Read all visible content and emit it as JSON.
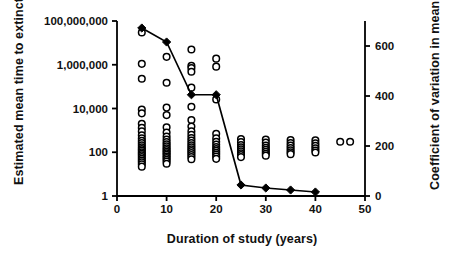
{
  "chart_data": {
    "type": "scatter",
    "title": "",
    "xlabel": "Duration of study (years)",
    "ylabel_left": "Estimated mean time to extinction (o)",
    "ylabel_right": "Coefficient of variation in mean time to extinction (line)",
    "xlim": [
      0,
      50
    ],
    "xticks": [
      0,
      10,
      20,
      30,
      40,
      50
    ],
    "xticklabels": [
      "0",
      "10",
      "20",
      "30",
      "40",
      "50"
    ],
    "left_axis": {
      "scale": "log",
      "ylim": [
        1,
        100000000
      ],
      "yticks": [
        1,
        100,
        10000,
        1000000,
        100000000
      ],
      "yticklabels": [
        "1",
        "100",
        "10,000",
        "1,000,000",
        "100,000,000"
      ]
    },
    "right_axis": {
      "scale": "linear",
      "ylim": [
        0,
        700
      ],
      "yticks": [
        0,
        200,
        400,
        600
      ],
      "yticklabels": [
        "0",
        "200",
        "400",
        "600"
      ]
    },
    "grid": false,
    "legend": "none (encoded in axis titles: open circles = mean time to extinction, line = coefficient of variation)",
    "series": [
      {
        "name": "Coefficient of variation in mean time to extinction",
        "marker": "filled-diamond",
        "line": true,
        "axis": "right",
        "x": [
          5,
          10,
          15,
          20,
          25,
          30,
          35,
          40
        ],
        "values": [
          672,
          616,
          405,
          405,
          44,
          32,
          24,
          16
        ]
      },
      {
        "name": "Estimated mean time to extinction",
        "marker": "open-circle",
        "line": false,
        "axis": "left",
        "points": [
          {
            "x": 5,
            "y": 30000000
          },
          {
            "x": 5,
            "y": 1100000
          },
          {
            "x": 5,
            "y": 230000
          },
          {
            "x": 5,
            "y": 9000
          },
          {
            "x": 5,
            "y": 6000
          },
          {
            "x": 5,
            "y": 2000
          },
          {
            "x": 5,
            "y": 1300
          },
          {
            "x": 5,
            "y": 900
          },
          {
            "x": 5,
            "y": 600
          },
          {
            "x": 5,
            "y": 430
          },
          {
            "x": 5,
            "y": 330
          },
          {
            "x": 5,
            "y": 260
          },
          {
            "x": 5,
            "y": 210
          },
          {
            "x": 5,
            "y": 170
          },
          {
            "x": 5,
            "y": 140
          },
          {
            "x": 5,
            "y": 120
          },
          {
            "x": 5,
            "y": 100
          },
          {
            "x": 5,
            "y": 85
          },
          {
            "x": 5,
            "y": 72
          },
          {
            "x": 5,
            "y": 60
          },
          {
            "x": 5,
            "y": 50
          },
          {
            "x": 5,
            "y": 42
          },
          {
            "x": 5,
            "y": 35
          },
          {
            "x": 5,
            "y": 28
          },
          {
            "x": 5,
            "y": 22
          },
          {
            "x": 10,
            "y": 2300000
          },
          {
            "x": 10,
            "y": 150000
          },
          {
            "x": 10,
            "y": 11000
          },
          {
            "x": 10,
            "y": 5000
          },
          {
            "x": 10,
            "y": 1400
          },
          {
            "x": 10,
            "y": 800
          },
          {
            "x": 10,
            "y": 520
          },
          {
            "x": 10,
            "y": 380
          },
          {
            "x": 10,
            "y": 290
          },
          {
            "x": 10,
            "y": 230
          },
          {
            "x": 10,
            "y": 185
          },
          {
            "x": 10,
            "y": 150
          },
          {
            "x": 10,
            "y": 125
          },
          {
            "x": 10,
            "y": 105
          },
          {
            "x": 10,
            "y": 90
          },
          {
            "x": 10,
            "y": 76
          },
          {
            "x": 10,
            "y": 64
          },
          {
            "x": 10,
            "y": 54
          },
          {
            "x": 10,
            "y": 45
          },
          {
            "x": 10,
            "y": 38
          },
          {
            "x": 10,
            "y": 30
          },
          {
            "x": 15,
            "y": 5000000
          },
          {
            "x": 15,
            "y": 900000
          },
          {
            "x": 15,
            "y": 700000
          },
          {
            "x": 15,
            "y": 480000
          },
          {
            "x": 15,
            "y": 90000
          },
          {
            "x": 15,
            "y": 12000
          },
          {
            "x": 15,
            "y": 3000
          },
          {
            "x": 15,
            "y": 1500
          },
          {
            "x": 15,
            "y": 900
          },
          {
            "x": 15,
            "y": 620
          },
          {
            "x": 15,
            "y": 450
          },
          {
            "x": 15,
            "y": 340
          },
          {
            "x": 15,
            "y": 265
          },
          {
            "x": 15,
            "y": 210
          },
          {
            "x": 15,
            "y": 170
          },
          {
            "x": 15,
            "y": 138
          },
          {
            "x": 15,
            "y": 112
          },
          {
            "x": 15,
            "y": 92
          },
          {
            "x": 15,
            "y": 75
          },
          {
            "x": 15,
            "y": 60
          },
          {
            "x": 15,
            "y": 48
          },
          {
            "x": 20,
            "y": 1900000
          },
          {
            "x": 20,
            "y": 820000
          },
          {
            "x": 20,
            "y": 26000
          },
          {
            "x": 20,
            "y": 700
          },
          {
            "x": 20,
            "y": 430
          },
          {
            "x": 20,
            "y": 300
          },
          {
            "x": 20,
            "y": 225
          },
          {
            "x": 20,
            "y": 175
          },
          {
            "x": 20,
            "y": 140
          },
          {
            "x": 20,
            "y": 115
          },
          {
            "x": 20,
            "y": 95
          },
          {
            "x": 20,
            "y": 78
          },
          {
            "x": 20,
            "y": 63
          },
          {
            "x": 20,
            "y": 50
          },
          {
            "x": 25,
            "y": 400
          },
          {
            "x": 25,
            "y": 290
          },
          {
            "x": 25,
            "y": 215
          },
          {
            "x": 25,
            "y": 168
          },
          {
            "x": 25,
            "y": 135
          },
          {
            "x": 25,
            "y": 110
          },
          {
            "x": 25,
            "y": 90
          },
          {
            "x": 25,
            "y": 74
          },
          {
            "x": 25,
            "y": 60
          },
          {
            "x": 30,
            "y": 380
          },
          {
            "x": 30,
            "y": 275
          },
          {
            "x": 30,
            "y": 205
          },
          {
            "x": 30,
            "y": 160
          },
          {
            "x": 30,
            "y": 128
          },
          {
            "x": 30,
            "y": 104
          },
          {
            "x": 30,
            "y": 85
          },
          {
            "x": 30,
            "y": 70
          },
          {
            "x": 35,
            "y": 360
          },
          {
            "x": 35,
            "y": 265
          },
          {
            "x": 35,
            "y": 200
          },
          {
            "x": 35,
            "y": 155
          },
          {
            "x": 35,
            "y": 124
          },
          {
            "x": 35,
            "y": 100
          },
          {
            "x": 35,
            "y": 82
          },
          {
            "x": 40,
            "y": 350
          },
          {
            "x": 40,
            "y": 258
          },
          {
            "x": 40,
            "y": 195
          },
          {
            "x": 40,
            "y": 152
          },
          {
            "x": 40,
            "y": 120
          },
          {
            "x": 40,
            "y": 97
          },
          {
            "x": 45,
            "y": 300
          },
          {
            "x": 47,
            "y": 300
          }
        ]
      }
    ]
  },
  "colors": {
    "axis": "#000000",
    "line": "#000000",
    "marker_open": "#ffffff",
    "marker_edge": "#000000",
    "background": "#ffffff"
  }
}
